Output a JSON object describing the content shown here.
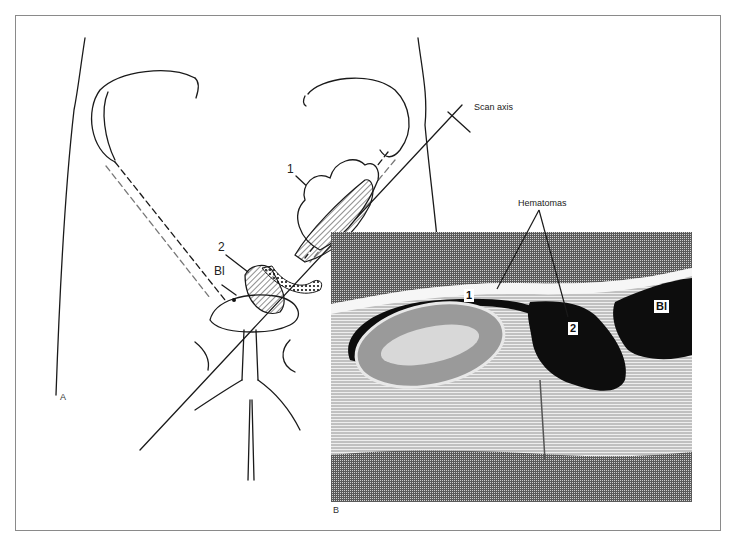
{
  "figure": {
    "panels": [
      {
        "id": "A",
        "label": "A",
        "description": "Line drawing of lower abdomen/pelvis with scan axis through hematomas"
      },
      {
        "id": "B",
        "label": "B",
        "description": "Ultrasound-style cross section along scan axis"
      }
    ],
    "panel_a": {
      "labels": {
        "scan_axis": "Scan axis",
        "hematoma_1": "1",
        "hematoma_2": "2",
        "bladder": "Bl"
      }
    },
    "panel_b": {
      "callout": "Hematomas",
      "labels": {
        "hematoma_1": "1",
        "hematoma_2": "2",
        "bladder": "Bl"
      }
    },
    "panel_letters": {
      "a": "A",
      "b": "B"
    },
    "colors": {
      "ink": "#1a1a1a",
      "frame": "#8a8a8a",
      "dark_fill": "#0d0d0d",
      "tissue_gray": "#8c8c8c"
    }
  }
}
